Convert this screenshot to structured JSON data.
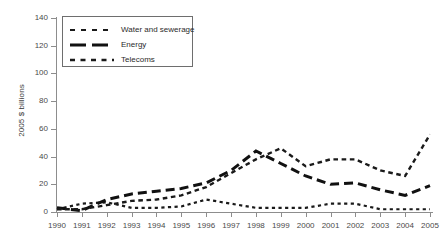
{
  "chart_data": {
    "type": "line",
    "title": "",
    "subtitle": "",
    "xlabel": "",
    "ylabel": "2005 $ billions",
    "x": [
      1990,
      1991,
      1992,
      1993,
      1994,
      1995,
      1996,
      1997,
      1998,
      1999,
      2000,
      2001,
      2002,
      2003,
      2004,
      2005
    ],
    "categories": [
      "1990",
      "1991",
      "1992",
      "1993",
      "1994",
      "1995",
      "1996",
      "1997",
      "1998",
      "1999",
      "2000",
      "2001",
      "2002",
      "2003",
      "2004",
      "2005"
    ],
    "xlim": [
      1990,
      2005
    ],
    "ylim": [
      0,
      140
    ],
    "yticks": [
      0,
      20,
      40,
      60,
      80,
      100,
      120,
      140
    ],
    "ytick_labels": [
      "0",
      "20",
      "40",
      "60",
      "80",
      "100",
      "120",
      "140"
    ],
    "grid": false,
    "legend_position": "top-left",
    "series": [
      {
        "name": "Water and sewerage",
        "style": "dotted",
        "color": "#1a1a1a",
        "values": [
          2,
          6,
          7,
          3,
          3,
          4,
          9,
          6,
          3,
          3,
          3,
          6,
          6,
          2,
          2,
          2
        ]
      },
      {
        "name": "Energy",
        "style": "long-dash",
        "color": "#111111",
        "values": [
          3,
          1,
          9,
          13,
          15,
          17,
          21,
          30,
          44,
          35,
          26,
          20,
          21,
          16,
          12,
          19
        ]
      },
      {
        "name": "Telecoms",
        "style": "dashed",
        "color": "#1a1a1a",
        "values": [
          2,
          2,
          5,
          8,
          9,
          12,
          18,
          28,
          38,
          46,
          33,
          38,
          38,
          30,
          26,
          56
        ]
      }
    ]
  },
  "legend": {
    "entries": [
      {
        "label": "Water and sewerage",
        "swatch": "dotted-line-swatch"
      },
      {
        "label": "Energy",
        "swatch": "long-dash-line-swatch"
      },
      {
        "label": "Telecoms",
        "swatch": "dashed-line-swatch"
      }
    ]
  }
}
